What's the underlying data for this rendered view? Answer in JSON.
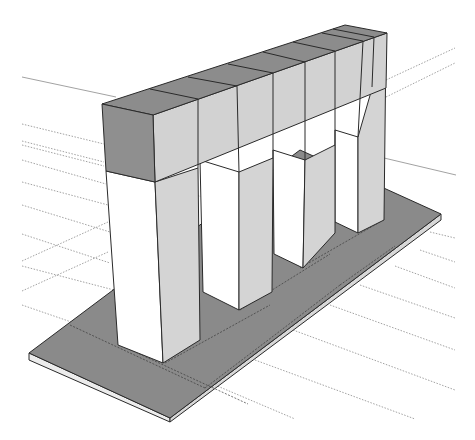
{
  "scene": {
    "description": "3D model of a colonnade: beam on four posts standing on a flat base slab",
    "colors": {
      "background": "#ffffff",
      "beam_top": "#8c8c8c",
      "beam_front_end": "#8f8f8f",
      "beam_side": "#d2d2d2",
      "post_front": "#ffffff",
      "post_side": "#d4d4d4",
      "base_top": "#8a8a8a",
      "base_edge": "#d8d8d8",
      "edge": "#2a2a2a",
      "guide": "#8a8a8a"
    },
    "post_count": 4,
    "beam_segments": 8
  }
}
